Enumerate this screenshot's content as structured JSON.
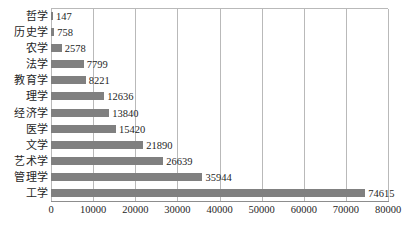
{
  "chart_data": {
    "type": "bar",
    "orientation": "horizontal",
    "title": "",
    "xlabel": "",
    "ylabel": "",
    "xlim": [
      0,
      80000
    ],
    "xticks": [
      0,
      10000,
      20000,
      30000,
      40000,
      50000,
      60000,
      70000,
      80000
    ],
    "xtick_labels": [
      "0",
      "10000",
      "20000",
      "30000",
      "40000",
      "50000",
      "60000",
      "70000",
      "80000"
    ],
    "grid": "vertical",
    "legend": "none",
    "bar_color": "#808080",
    "grid_color": "#b9b9b9",
    "categories": [
      "哲学",
      "历史学",
      "农学",
      "法学",
      "教育学",
      "理学",
      "经济学",
      "医学",
      "文学",
      "艺术学",
      "管理学",
      "工学"
    ],
    "values": [
      147,
      758,
      2578,
      7799,
      8221,
      12636,
      13840,
      15420,
      21890,
      26639,
      35944,
      74615
    ],
    "value_labels": [
      "147",
      "758",
      "2578",
      "7799",
      "8221",
      "12636",
      "13840",
      "15420",
      "21890",
      "26639",
      "35944",
      "74615"
    ],
    "series": [
      {
        "name": "",
        "values": [
          147,
          758,
          2578,
          7799,
          8221,
          12636,
          13840,
          15420,
          21890,
          26639,
          35944,
          74615
        ]
      }
    ],
    "points": [
      {
        "category": "哲学",
        "value": 147,
        "label": "147"
      },
      {
        "category": "历史学",
        "value": 758,
        "label": "758"
      },
      {
        "category": "农学",
        "value": 2578,
        "label": "2578"
      },
      {
        "category": "法学",
        "value": 7799,
        "label": "7799"
      },
      {
        "category": "教育学",
        "value": 8221,
        "label": "8221"
      },
      {
        "category": "理学",
        "value": 12636,
        "label": "12636"
      },
      {
        "category": "经济学",
        "value": 13840,
        "label": "13840"
      },
      {
        "category": "医学",
        "value": 15420,
        "label": "15420"
      },
      {
        "category": "文学",
        "value": 21890,
        "label": "21890"
      },
      {
        "category": "艺术学",
        "value": 26639,
        "label": "26639"
      },
      {
        "category": "管理学",
        "value": 35944,
        "label": "35944"
      },
      {
        "category": "工学",
        "value": 74615,
        "label": "74615"
      }
    ]
  }
}
